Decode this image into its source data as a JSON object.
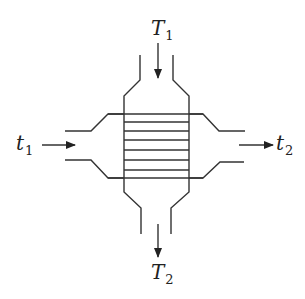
{
  "diagram": {
    "title": "",
    "type": "heat exchanger schematic",
    "labels": {
      "hot_inlet": {
        "base": "T",
        "sub": "1"
      },
      "hot_outlet": {
        "base": "T",
        "sub": "2"
      },
      "cold_inlet": {
        "base": "t",
        "sub": "1"
      },
      "cold_outlet": {
        "base": "t",
        "sub": "2"
      }
    },
    "tube_count": 8,
    "colors": {
      "stroke": "#333333",
      "background": "#ffffff"
    }
  }
}
